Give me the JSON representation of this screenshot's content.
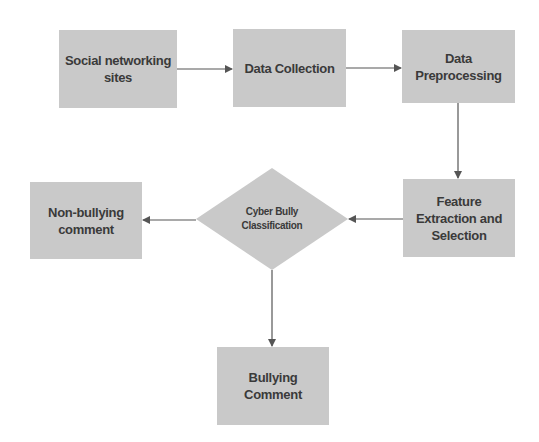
{
  "diagram": {
    "type": "flowchart",
    "colors": {
      "node_fill": "#c9c9c9",
      "text": "#3a3a3a",
      "edge": "#555555",
      "background": "#ffffff"
    },
    "nodes": {
      "social_networking_sites": {
        "label": "Social networking\nsites",
        "shape": "rectangle"
      },
      "data_collection": {
        "label": "Data Collection",
        "shape": "rectangle"
      },
      "data_preprocessing": {
        "label": "Data\nPreprocessing",
        "shape": "rectangle"
      },
      "feature_extraction": {
        "label": "Feature\nExtraction and\nSelection",
        "shape": "rectangle"
      },
      "cyber_bully_classification": {
        "label": "Cyber Bully\nClassification",
        "shape": "diamond"
      },
      "non_bullying_comment": {
        "label": "Non-bullying\ncomment",
        "shape": "rectangle"
      },
      "bullying_comment": {
        "label": "Bullying\nComment",
        "shape": "rectangle"
      }
    },
    "edges": [
      {
        "from": "social_networking_sites",
        "to": "data_collection"
      },
      {
        "from": "data_collection",
        "to": "data_preprocessing"
      },
      {
        "from": "data_preprocessing",
        "to": "feature_extraction"
      },
      {
        "from": "feature_extraction",
        "to": "cyber_bully_classification"
      },
      {
        "from": "cyber_bully_classification",
        "to": "non_bullying_comment"
      },
      {
        "from": "cyber_bully_classification",
        "to": "bullying_comment"
      }
    ]
  }
}
